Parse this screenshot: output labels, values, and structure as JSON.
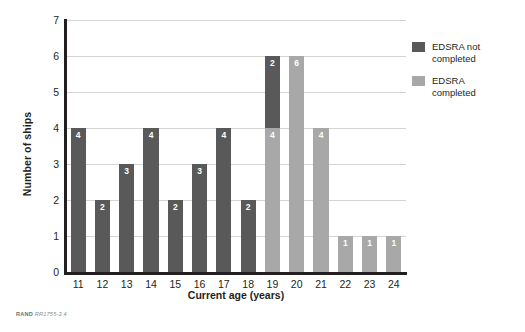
{
  "chart_data": {
    "type": "bar",
    "subtype": "stacked-vertical",
    "title": "",
    "xlabel": "Current age (years)",
    "ylabel": "Number of ships",
    "categories": [
      "11",
      "12",
      "13",
      "14",
      "15",
      "16",
      "17",
      "18",
      "19",
      "20",
      "21",
      "22",
      "23",
      "24"
    ],
    "series": [
      {
        "name": "EDSRA completed",
        "color": "#a8a8a8",
        "values": [
          0,
          0,
          0,
          0,
          0,
          0,
          0,
          0,
          4,
          6,
          4,
          1,
          1,
          1
        ]
      },
      {
        "name": "EDSRA not completed",
        "color": "#595959",
        "values": [
          4,
          2,
          3,
          4,
          2,
          3,
          4,
          2,
          2,
          0,
          0,
          0,
          0,
          0
        ]
      }
    ],
    "bar_labels": [
      {
        "category": "11",
        "segments": [
          {
            "series": "EDSRA not completed",
            "label": "4"
          }
        ]
      },
      {
        "category": "12",
        "segments": [
          {
            "series": "EDSRA not completed",
            "label": "2"
          }
        ]
      },
      {
        "category": "13",
        "segments": [
          {
            "series": "EDSRA not completed",
            "label": "3"
          }
        ]
      },
      {
        "category": "14",
        "segments": [
          {
            "series": "EDSRA not completed",
            "label": "4"
          }
        ]
      },
      {
        "category": "15",
        "segments": [
          {
            "series": "EDSRA not completed",
            "label": "2"
          }
        ]
      },
      {
        "category": "16",
        "segments": [
          {
            "series": "EDSRA not completed",
            "label": "3"
          }
        ]
      },
      {
        "category": "17",
        "segments": [
          {
            "series": "EDSRA not completed",
            "label": "4"
          }
        ]
      },
      {
        "category": "18",
        "segments": [
          {
            "series": "EDSRA not completed",
            "label": "2"
          }
        ]
      },
      {
        "category": "19",
        "segments": [
          {
            "series": "EDSRA completed",
            "label": "4"
          },
          {
            "series": "EDSRA not completed",
            "label": "2"
          }
        ]
      },
      {
        "category": "20",
        "segments": [
          {
            "series": "EDSRA completed",
            "label": "6"
          }
        ]
      },
      {
        "category": "21",
        "segments": [
          {
            "series": "EDSRA completed",
            "label": "4"
          }
        ]
      },
      {
        "category": "22",
        "segments": [
          {
            "series": "EDSRA completed",
            "label": "1"
          }
        ]
      },
      {
        "category": "23",
        "segments": [
          {
            "series": "EDSRA completed",
            "label": "1"
          }
        ]
      },
      {
        "category": "24",
        "segments": [
          {
            "series": "EDSRA completed",
            "label": "1"
          }
        ]
      }
    ],
    "ylim": [
      0,
      7
    ],
    "yticks": [
      "0",
      "1",
      "2",
      "3",
      "4",
      "5",
      "6",
      "7"
    ],
    "grid": "horizontal",
    "legend_position": "right"
  },
  "legend": {
    "items": [
      {
        "label_line1": "EDSRA not",
        "label_line2": "completed",
        "color": "#595959"
      },
      {
        "label_line1": "EDSRA",
        "label_line2": "completed",
        "color": "#a8a8a8"
      }
    ]
  },
  "credit": {
    "brand": "RAND",
    "id": "RR1755-3.4"
  }
}
